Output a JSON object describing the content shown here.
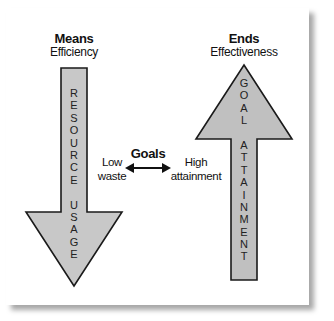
{
  "means": {
    "title": "Means",
    "subtitle": "Efficiency",
    "arrow_direction": "down",
    "arrow_text": "RESOURCE USAGE",
    "side_label_line1": "Low",
    "side_label_line2": "waste"
  },
  "ends": {
    "title": "Ends",
    "subtitle": "Effectiveness",
    "arrow_direction": "up",
    "arrow_text": "GOAL ATTAINMENT",
    "side_label_line1": "High",
    "side_label_line2": "attainment"
  },
  "center": {
    "label": "Goals",
    "connector": "double-headed-arrow"
  },
  "colors": {
    "arrow_fill": "#c8c8c8",
    "arrow_stroke": "#1a1a1a",
    "text": "#111111",
    "background": "#ffffff"
  }
}
